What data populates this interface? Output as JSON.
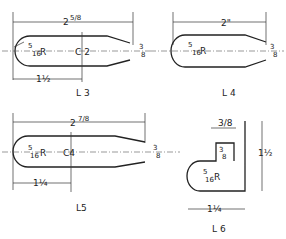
{
  "parts": [
    {
      "id": "L3",
      "label": "L3",
      "center_label": "C 2",
      "length": "2 5/8\"",
      "radius": "5/16\" R",
      "tip": "3/8\"",
      "offset": "1 1/2\""
    },
    {
      "id": "L4",
      "label": "L 4",
      "length": "2\"",
      "radius": "5/16\" R",
      "tip": "3/8\""
    },
    {
      "id": "L5",
      "label": "L5",
      "center_label": "C4",
      "length": "2 7/8\"",
      "radius": "5/16\" R",
      "tip": "3/8\"",
      "offset": "1 1/4\""
    },
    {
      "id": "L6",
      "label": "L 6",
      "width_top": "3/8\"",
      "notch": "3/8\"",
      "height": "1 1/2\"",
      "radius": "5/16\" R",
      "base": "1 1/4\""
    }
  ],
  "text": {
    "l3_len": "2",
    "l3_len_f": "5/8",
    "l3_r1": "5",
    "l3_r2": "16",
    "l3_R": "R",
    "l3_c": "C 2",
    "l3_tip1": "3",
    "l3_tip2": "8",
    "l3_off": "1½",
    "l3_lbl": "L 3",
    "l4_len": "2\"",
    "l4_r1": "5",
    "l4_r2": "16",
    "l4_R": "R",
    "l4_tip1": "3",
    "l4_tip2": "8",
    "l4_lbl": "L 4",
    "l5_len": "2",
    "l5_len_f": "7/8",
    "l5_r1": "5",
    "l5_r2": "16",
    "l5_R": "R",
    "l5_c": "C4",
    "l5_tip1": "3",
    "l5_tip2": "8",
    "l5_off": "1¼",
    "l5_lbl": "L5",
    "l6_w": "3/8",
    "l6_n1": "3",
    "l6_n2": "8",
    "l6_h": "1½",
    "l6_r1": "5",
    "l6_r2": "16",
    "l6_R": "R",
    "l6_b": "1¼",
    "l6_lbl": "L 6"
  }
}
